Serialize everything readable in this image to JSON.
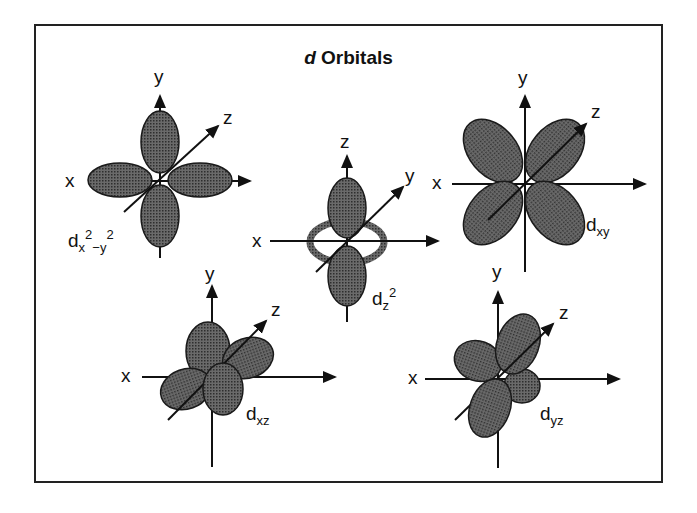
{
  "title": {
    "italic": "d",
    "rest": " Orbitals"
  },
  "colors": {
    "lobe": "#4a4a4a",
    "lobe_edge": "#1a1a1a",
    "axis": "#111111",
    "frame": "#222222"
  },
  "orbitals": [
    {
      "id": "dx2-y2",
      "label_main": "d",
      "label_sub": "x",
      "label_sup1": "2",
      "label_mid": "−y",
      "label_sup2": "2",
      "axes": {
        "up": "y",
        "left": "x",
        "diag": "z"
      }
    },
    {
      "id": "dz2",
      "label_main": "d",
      "label_sub": "z",
      "label_sup": "2",
      "axes": {
        "up": "z",
        "left": "x",
        "diag": "y"
      }
    },
    {
      "id": "dxy",
      "label_main": "d",
      "label_sub": "xy",
      "axes": {
        "up": "y",
        "left": "x",
        "diag": "z"
      }
    },
    {
      "id": "dxz",
      "label_main": "d",
      "label_sub": "xz",
      "axes": {
        "up": "y",
        "left": "x",
        "diag": "z"
      }
    },
    {
      "id": "dyz",
      "label_main": "d",
      "label_sub": "yz",
      "axes": {
        "up": "y",
        "left": "x",
        "diag": "z"
      }
    }
  ]
}
